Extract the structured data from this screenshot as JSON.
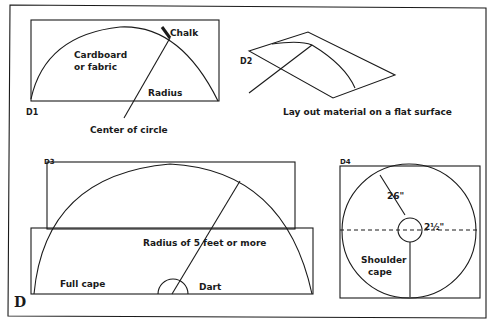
{
  "figure": {
    "label": "D",
    "panels": {
      "d1": {
        "id": "D1",
        "material": "Cardboard or fabric",
        "material_line1": "Cardboard",
        "material_line2": "or fabric",
        "chalk": "Chalk",
        "radius": "Radius",
        "center": "Center of circle"
      },
      "d2": {
        "id": "D2",
        "caption": "Lay out material on a flat surface"
      },
      "d3": {
        "id": "D3",
        "radius": "Radius of 5 feet or more",
        "full_cape": "Full cape",
        "dart": "Dart"
      },
      "d4": {
        "id": "D4",
        "outer_radius": "26\"",
        "inner_radius": "2½\"",
        "label_line1": "Shoulder",
        "label_line2": "cape"
      }
    }
  }
}
